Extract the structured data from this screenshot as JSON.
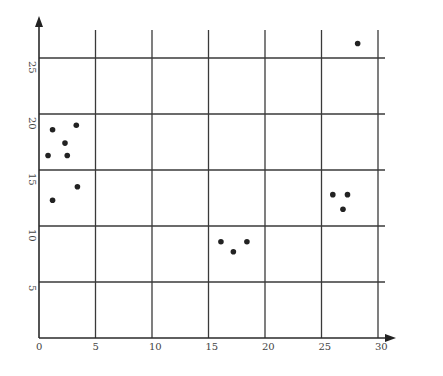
{
  "chart_data": {
    "type": "scatter",
    "title": "",
    "xlabel": "",
    "ylabel": "",
    "xlim": [
      0,
      30
    ],
    "ylim": [
      0,
      25
    ],
    "x_ticks": [
      "0",
      "5",
      "10",
      "15",
      "20",
      "25",
      "30"
    ],
    "y_ticks": [
      "5",
      "10",
      "15",
      "20",
      "25"
    ],
    "grid": true,
    "legend": null,
    "series": [
      {
        "name": "points",
        "points": [
          {
            "x": 1.2,
            "y": 18.6
          },
          {
            "x": 3.3,
            "y": 19.0
          },
          {
            "x": 2.3,
            "y": 17.4
          },
          {
            "x": 0.8,
            "y": 16.3
          },
          {
            "x": 2.5,
            "y": 16.3
          },
          {
            "x": 3.4,
            "y": 13.5
          },
          {
            "x": 1.2,
            "y": 12.3
          },
          {
            "x": 16.1,
            "y": 8.6
          },
          {
            "x": 17.2,
            "y": 7.7
          },
          {
            "x": 18.4,
            "y": 8.6
          },
          {
            "x": 26.0,
            "y": 12.8
          },
          {
            "x": 27.3,
            "y": 12.8
          },
          {
            "x": 26.9,
            "y": 11.5
          },
          {
            "x": 28.2,
            "y": 26.3
          }
        ]
      }
    ]
  },
  "colors": {
    "grid": "#3a3a3a",
    "points": "#222222",
    "background": "#ffffff"
  }
}
